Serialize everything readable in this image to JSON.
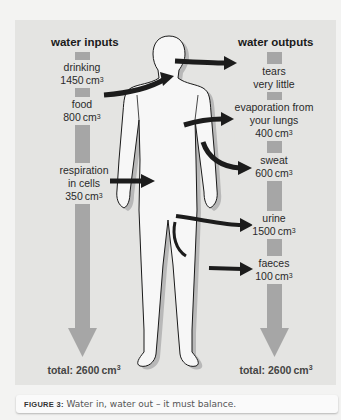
{
  "diagram": {
    "inputs": {
      "title": "water inputs",
      "items": [
        {
          "name": "drinking",
          "value": "1450",
          "unit": "cm",
          "exp": "3"
        },
        {
          "name": "food",
          "value": "800",
          "unit": "cm",
          "exp": "3"
        },
        {
          "name_line1": "respiration",
          "name_line2": "in cells",
          "value": "350",
          "unit": "cm",
          "exp": "3"
        }
      ],
      "total_label": "total: 2600",
      "total_unit": "cm",
      "total_exp": "3"
    },
    "outputs": {
      "title": "water outputs",
      "items": [
        {
          "name": "tears",
          "value_text": "very little"
        },
        {
          "name_line1": "evaporation from",
          "name_line2": "your lungs",
          "value": "400",
          "unit": "cm",
          "exp": "3"
        },
        {
          "name": "sweat",
          "value": "600",
          "unit": "cm",
          "exp": "3"
        },
        {
          "name": "urine",
          "value": "1500",
          "unit": "cm",
          "exp": "3"
        },
        {
          "name": "faeces",
          "value": "100",
          "unit": "cm",
          "exp": "3"
        }
      ],
      "total_label": "total: 2600",
      "total_unit": "cm",
      "total_exp": "3"
    },
    "colors": {
      "panel": "#e4e4e2",
      "bar": "#a6a6a6",
      "arrow": "#1c1c1c",
      "body_fill": "#f7f7f7",
      "body_shadow": "#b8b8b8"
    }
  },
  "caption": {
    "figure_number": "FIGURE 3:",
    "text": "Water in, water out – it must balance."
  }
}
